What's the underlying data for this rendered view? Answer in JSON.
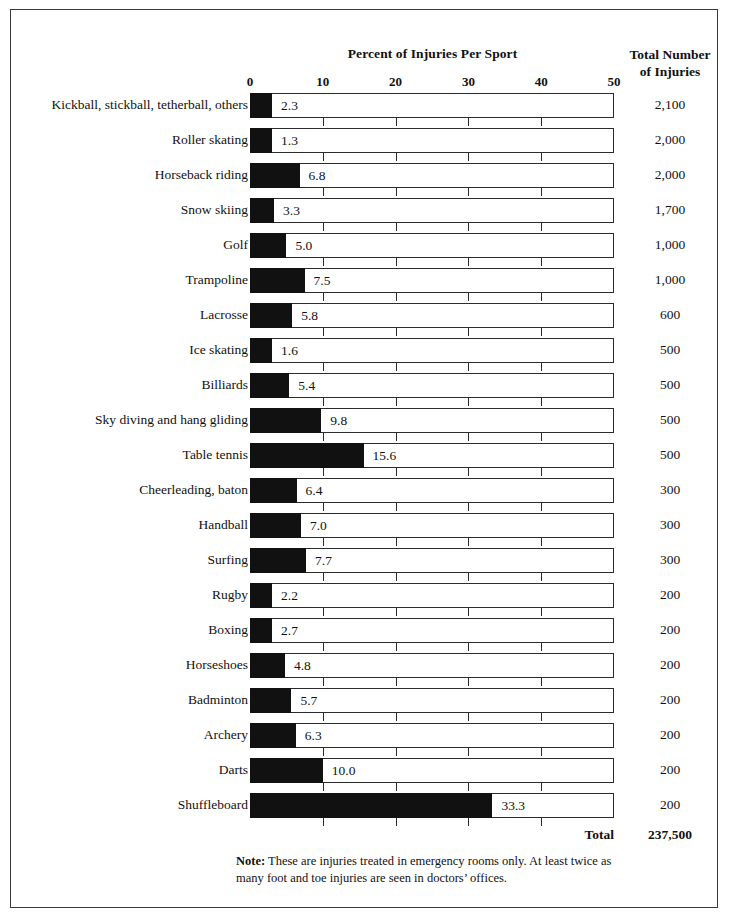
{
  "header": {
    "chart_title": "Percent of Injuries Per Sport",
    "right_column_line1": "Total Number",
    "right_column_line2": "of Injuries"
  },
  "footer": {
    "total_label": "Total",
    "total_value": "237,500",
    "note_label": "Note:",
    "note_text": " These are injuries treated in emergency rooms only. At least twice as many foot and toe injuries are seen in doctors’ offices."
  },
  "chart_data": {
    "type": "bar",
    "orientation": "horizontal",
    "title": "Percent of Injuries Per Sport",
    "xlabel": "",
    "ylabel": "",
    "xlim": [
      0,
      50
    ],
    "xticks": [
      0,
      10,
      20,
      30,
      40,
      50
    ],
    "xtick_labels": [
      "0",
      "10",
      "20",
      "30",
      "40",
      "50"
    ],
    "grid": false,
    "legend": "none",
    "value_label_format": "one-decimal",
    "second_column_header": "Total Number of Injuries",
    "categories": [
      "Kickball, stickball, tetherball, others",
      "Roller skating",
      "Horseback riding",
      "Snow skiing",
      "Golf",
      "Trampoline",
      "Lacrosse",
      "Ice skating",
      "Billiards",
      "Sky diving and hang gliding",
      "Table tennis",
      "Cheerleading, baton",
      "Handball",
      "Surfing",
      "Rugby",
      "Boxing",
      "Horseshoes",
      "Badminton",
      "Archery",
      "Darts",
      "Shuffleboard"
    ],
    "values": [
      2.3,
      1.3,
      6.8,
      3.3,
      5.0,
      7.5,
      5.8,
      1.6,
      5.4,
      9.8,
      15.6,
      6.4,
      7.0,
      7.7,
      2.2,
      2.7,
      4.8,
      5.7,
      6.3,
      10.0,
      33.3
    ],
    "value_labels": [
      "2.3",
      "1.3",
      "6.8",
      "3.3",
      "5.0",
      "7.5",
      "5.8",
      "1.6",
      "5.4",
      "9.8",
      "15.6",
      "6.4",
      "7.0",
      "7.7",
      "2.2",
      "2.7",
      "4.8",
      "5.7",
      "6.3",
      "10.0",
      "33.3"
    ],
    "totals": [
      "2,100",
      "2,000",
      "2,000",
      "1,700",
      "1,000",
      "1,000",
      "600",
      "500",
      "500",
      "500",
      "500",
      "300",
      "300",
      "300",
      "200",
      "200",
      "200",
      "200",
      "200",
      "200",
      "200"
    ],
    "total_sum": "237,500",
    "colors": {
      "bar_fill": "#111111",
      "bar_outline": "#2b2b2b",
      "background": "#ffffff",
      "text": "#111111"
    }
  }
}
